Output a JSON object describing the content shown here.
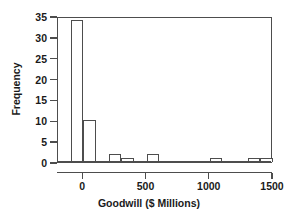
{
  "chart_data": {
    "type": "bar",
    "title": "",
    "subtitle": "",
    "xlabel": "Goodwill ($ Millions)",
    "ylabel": "Frequency",
    "xlim": [
      -200,
      1500
    ],
    "ylim": [
      0,
      35
    ],
    "grid": false,
    "legend": null,
    "bin_width": 100,
    "x_ticks": [
      {
        "value": 0,
        "label": "0"
      },
      {
        "value": 500,
        "label": "500"
      },
      {
        "value": 1000,
        "label": "1000"
      },
      {
        "value": 1500,
        "label": "1500"
      }
    ],
    "y_ticks": [
      {
        "value": 0,
        "label": "0"
      },
      {
        "value": 5,
        "label": "5"
      },
      {
        "value": 10,
        "label": "10"
      },
      {
        "value": 15,
        "label": "15"
      },
      {
        "value": 20,
        "label": "20"
      },
      {
        "value": 25,
        "label": "25"
      },
      {
        "value": 30,
        "label": "30"
      },
      {
        "value": 35,
        "label": "35"
      }
    ],
    "bins": [
      {
        "start": -100,
        "end": 0,
        "frequency": 34
      },
      {
        "start": 0,
        "end": 100,
        "frequency": 10
      },
      {
        "start": 100,
        "end": 200,
        "frequency": 0
      },
      {
        "start": 200,
        "end": 300,
        "frequency": 2
      },
      {
        "start": 300,
        "end": 400,
        "frequency": 1
      },
      {
        "start": 400,
        "end": 500,
        "frequency": 0
      },
      {
        "start": 500,
        "end": 600,
        "frequency": 2
      },
      {
        "start": 600,
        "end": 700,
        "frequency": 0
      },
      {
        "start": 700,
        "end": 800,
        "frequency": 0
      },
      {
        "start": 800,
        "end": 900,
        "frequency": 0
      },
      {
        "start": 900,
        "end": 1000,
        "frequency": 0
      },
      {
        "start": 1000,
        "end": 1100,
        "frequency": 1
      },
      {
        "start": 1100,
        "end": 1200,
        "frequency": 0
      },
      {
        "start": 1200,
        "end": 1300,
        "frequency": 0
      },
      {
        "start": 1300,
        "end": 1400,
        "frequency": 1
      },
      {
        "start": 1400,
        "end": 1500,
        "frequency": 1
      }
    ],
    "categories": [
      "-100",
      "0",
      "100",
      "200",
      "300",
      "400",
      "500",
      "600",
      "700",
      "800",
      "900",
      "1000",
      "1100",
      "1200",
      "1300",
      "1400"
    ],
    "values": [
      34,
      10,
      0,
      2,
      1,
      0,
      2,
      0,
      0,
      0,
      0,
      1,
      0,
      0,
      1,
      1
    ]
  },
  "colors": {
    "axis": "#4d4d4d",
    "bar_outline": "#4d4d4d",
    "bar_fill": "#ffffff",
    "text": "#1a1a1a",
    "background": "#ffffff"
  }
}
